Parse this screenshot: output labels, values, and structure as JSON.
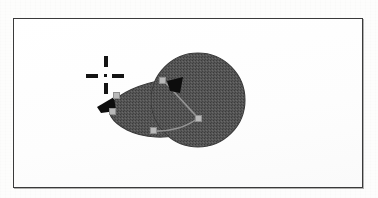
{
  "document": {
    "kind": "scanned-figure",
    "title": "Vector shape editing canvas"
  },
  "canvas": {
    "name": "drawing-canvas",
    "background_color": "#ffffff",
    "border_color": "#3a3a3a",
    "frame": {
      "x": 13,
      "y": 18,
      "width": 350,
      "height": 170
    }
  },
  "palette": {
    "shape_fill": "#5a5a5a",
    "shape_fill_texture": "#4e4e4e",
    "shape_outline": "#3d3d3d",
    "node_fill": "#b9b9b9",
    "node_stroke": "#8f8f8f",
    "arrow_fill": "#0d0d0d",
    "crosshair_color": "#141414",
    "paper": "#fdfdfc"
  },
  "artwork": {
    "circle": {
      "name": "filled-circle",
      "center_x": 198,
      "center_y": 100,
      "radius": 47,
      "fill": "#5a5a5a"
    },
    "teardrop": {
      "name": "teardrop-shape",
      "description": "comma / teardrop body tapering to a point at the left",
      "path": "M 198 100 L 163 80 C 140 84 120 94 112 104 C 106 112 112 122 126 130 C 142 138 168 140 186 132 C 196 128 200 116 198 100 Z",
      "fill": "#5a5a5a"
    },
    "inner_edges": [
      {
        "name": "edge-upper",
        "path": "M 163 80 L 198 118"
      },
      {
        "name": "edge-lower",
        "path": "M 198 118 C 186 128 168 132 150 131"
      }
    ],
    "nodes": [
      {
        "name": "node-upper-right",
        "x": 162,
        "y": 80
      },
      {
        "name": "node-center-right",
        "x": 198,
        "y": 118
      },
      {
        "name": "node-left-upper",
        "x": 116,
        "y": 95
      },
      {
        "name": "node-left-lower",
        "x": 111,
        "y": 110
      },
      {
        "name": "node-bottom",
        "x": 153,
        "y": 130
      }
    ],
    "arrows": [
      {
        "name": "arrow-direction-right",
        "x": 166,
        "y": 76,
        "points": "0,4 16,0 13,16 3,14",
        "fill": "#0d0d0d"
      },
      {
        "name": "arrow-direction-left",
        "x": 97,
        "y": 96,
        "points": "0,10 16,0 18,14 4,16",
        "fill": "#0d0d0d"
      }
    ]
  },
  "crosshair": {
    "name": "crosshair-marker",
    "x": 86,
    "y": 56,
    "size": 40,
    "color": "#141414",
    "style": "dashed-cross-with-center-dot"
  }
}
